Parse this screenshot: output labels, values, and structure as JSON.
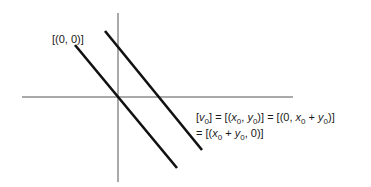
{
  "diagram": {
    "type": "coordinate-plane-lines",
    "origin_label": "[(0, 0)]",
    "axes": {
      "horizontal": {
        "x1": 22,
        "y1": 97,
        "x2": 293,
        "y2": 97
      },
      "vertical": {
        "x1": 118,
        "y1": 13,
        "x2": 118,
        "y2": 182
      }
    },
    "lines": [
      {
        "name": "line-through-origin",
        "x1": 75,
        "y1": 45,
        "x2": 177,
        "y2": 168
      },
      {
        "name": "parallel-line",
        "x1": 105,
        "y1": 31,
        "x2": 202,
        "y2": 150
      }
    ],
    "equation": {
      "line1": {
        "v": "v",
        "v_sub": "0",
        "eq1": "] = [(",
        "x": "x",
        "x_sub": "0",
        "comma": ", ",
        "y": "y",
        "y_sub": "0",
        "eq2": ")] = [(0, ",
        "x2": "x",
        "x2_sub": "0",
        "plus": " + ",
        "y2": "y",
        "y2_sub": "0",
        "end": ")]"
      },
      "line2": {
        "start": "= [(",
        "x": "x",
        "x_sub": "0",
        "plus": " + ",
        "y": "y",
        "y_sub": "0",
        "end": ", 0)]"
      }
    },
    "colors": {
      "axis": "#555555",
      "line": "#111111",
      "text": "#1a1a1a"
    }
  }
}
